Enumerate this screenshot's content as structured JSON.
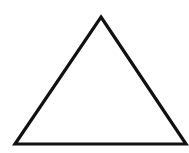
{
  "canvas": {
    "width": 189,
    "height": 153,
    "background": "#ffffff"
  },
  "shape": {
    "type": "triangle",
    "fill": "#ffffff",
    "stroke": "#111111",
    "stroke_width": 3.2,
    "vertices": [
      {
        "name": "apex",
        "x": 101,
        "y": 17
      },
      {
        "name": "bottom-right",
        "x": 186,
        "y": 144
      },
      {
        "name": "bottom-left",
        "x": 15,
        "y": 144
      }
    ]
  }
}
